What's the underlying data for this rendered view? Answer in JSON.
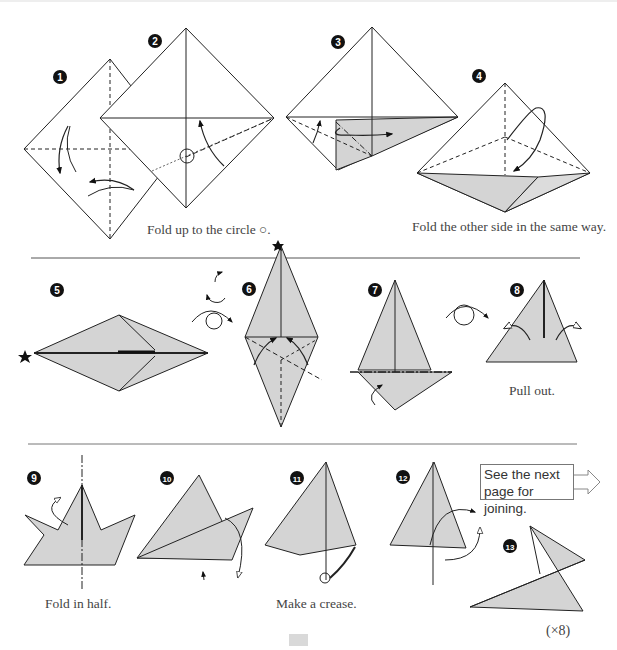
{
  "diagram": {
    "colors": {
      "paper_shade": "#d4d4d4",
      "line": "#222222",
      "divider": "#555555",
      "background": "#ffffff"
    },
    "steps": [
      {
        "number": "1",
        "label": ""
      },
      {
        "number": "2",
        "label": ""
      },
      {
        "number": "3",
        "label": ""
      },
      {
        "number": "4",
        "label": ""
      },
      {
        "number": "5",
        "label": ""
      },
      {
        "number": "6",
        "label": ""
      },
      {
        "number": "7",
        "label": ""
      },
      {
        "number": "8",
        "label": ""
      },
      {
        "number": "9",
        "label": ""
      },
      {
        "number": "10",
        "label": ""
      },
      {
        "number": "11",
        "label": ""
      },
      {
        "number": "12",
        "label": ""
      },
      {
        "number": "13",
        "label": ""
      }
    ],
    "captions": {
      "step2": "Fold up to the circle ○.",
      "step4": "Fold the other side in the same way.",
      "step8": "Pull out.",
      "step9": "Fold in half.",
      "step11": "Make a crease."
    },
    "note": {
      "line1": "See the next",
      "line2": "page for joining."
    },
    "multiplier": "(×8)"
  }
}
